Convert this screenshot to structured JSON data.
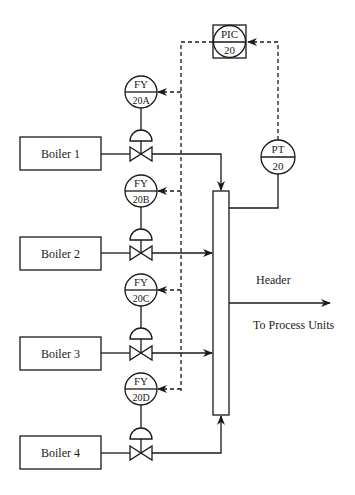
{
  "diagram": {
    "type": "process-control-piping-diagram",
    "controller": {
      "tag": "PIC",
      "number": "20",
      "symbol": "shared-display-controller"
    },
    "transmitter": {
      "tag": "PT",
      "number": "20"
    },
    "boilers": [
      {
        "label": "Boiler 1",
        "fy_tag": "FY",
        "fy_number": "20A"
      },
      {
        "label": "Boiler 2",
        "fy_tag": "FY",
        "fy_number": "20B"
      },
      {
        "label": "Boiler 3",
        "fy_tag": "FY",
        "fy_number": "20C"
      },
      {
        "label": "Boiler 4",
        "fy_tag": "FY",
        "fy_number": "20D"
      }
    ],
    "header_label": "Header",
    "outlet_label": "To Process Units",
    "colors": {
      "line": "#1a1a1a",
      "background": "#ffffff"
    }
  }
}
